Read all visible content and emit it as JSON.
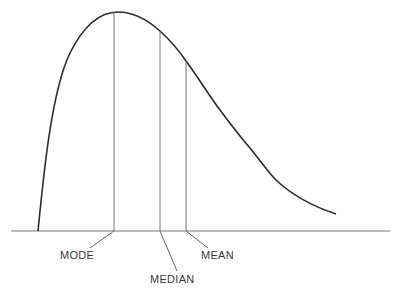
{
  "diagram": {
    "type": "right-skewed distribution curve",
    "labels": {
      "mode": "MODE",
      "median": "MEDIAN",
      "mean": "MEAN"
    },
    "colors": {
      "curve": "#2a2a2a",
      "lines": "#666666",
      "text": "#3a3a3a"
    }
  }
}
